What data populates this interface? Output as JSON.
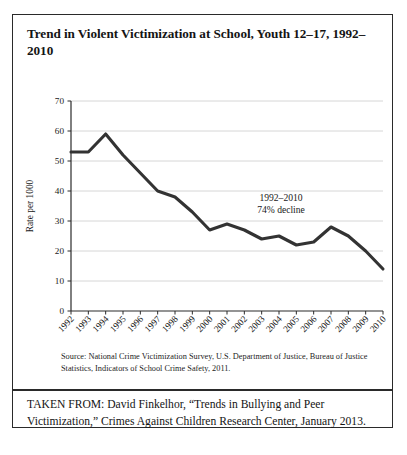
{
  "figure": {
    "title": "Trend in Violent Victimization at School, Youth 12–17, 1992–2010",
    "source_note": "Source: National Crime Victimization Survey, U.S. Department of Justice, Bureau of Justice Statistics, Indicators of School Crime Safety, 2011.",
    "taken_from": "TAKEN FROM: David Finkelhor, “Trends in Bullying and Peer Victimization,” Crimes Against Children Research Center, January 2013."
  },
  "chart_data": {
    "type": "line",
    "title": "Trend in Violent Victimization at School, Youth 12–17, 1992–2010",
    "xlabel": "",
    "ylabel": "Rate per 1000",
    "categories": [
      "1992",
      "1993",
      "1994",
      "1995",
      "1996",
      "1997",
      "1998",
      "1999",
      "2000",
      "2001",
      "2002",
      "2003",
      "2004",
      "2005",
      "2006",
      "2007",
      "2008",
      "2009",
      "2010"
    ],
    "values": [
      53,
      53,
      59,
      52,
      46,
      40,
      38,
      33,
      27,
      29,
      27,
      24,
      25,
      22,
      23,
      28,
      25,
      20,
      14
    ],
    "ylim": [
      0,
      70
    ],
    "yticks": [
      0,
      10,
      20,
      30,
      40,
      50,
      60,
      70
    ],
    "grid": true,
    "legend": "none",
    "line_color": "#333333",
    "annotations": [
      {
        "line1": "1992–2010",
        "line2": "74% decline"
      }
    ]
  }
}
